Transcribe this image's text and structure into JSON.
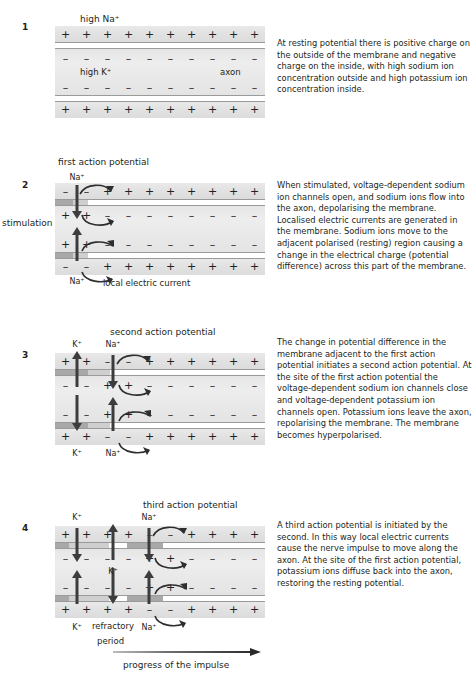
{
  "figure": {
    "bottom_arrow_label": "progress of the impulse",
    "side_label_stimulation": "stimulation"
  },
  "ions": {
    "sodium": "Na",
    "potassium": "K",
    "plus": "+",
    "minus": "–"
  },
  "panels": [
    {
      "number": "1",
      "top_label": "high Na⁺",
      "inside_label_left": "high K⁺",
      "inside_label_right": "axon",
      "text": "At resting potential there is positive charge on the outside of the membrane and negative charge on the inside, with high sodium ion concentration outside and high potassium ion concentration inside.",
      "outer_top_charges": "+ + + + + + + + + +",
      "inner_top_charges": "– – – – – – – – – –",
      "inner_bottom_charges": "– – – – – – – – – –",
      "outer_bottom_charges": "+ + + + + + + + + +"
    },
    {
      "number": "2",
      "top_label": "first action potential",
      "ion_label_top": "Na⁺",
      "ion_label_bottom": "Na⁺",
      "current_label": "local electric current",
      "side_label": "stimulation",
      "text": "When stimulated, voltage-dependent sodium ion channels open, and sodium ions flow into the axon, depolarising the membrane. Localised electric currents are generated in the membrane. Sodium ions move to the adjacent polarised (resting) region causing a change in the electrical charge (potential difference) across this part of the membrane."
    },
    {
      "number": "3",
      "top_label": "second action potential",
      "ion_label_k_top": "K⁺",
      "ion_label_k_bottom": "K⁺",
      "ion_label_na_top": "Na⁺",
      "ion_label_na_bottom": "Na⁺",
      "text": "The change in potential difference in the membrane adjacent to the first action potential initiates a second action potential. At the site of the first action potential the voltage-dependent sodium ion channels close and voltage-dependent potassium ion channels open. Potassium ions leave the axon, repolarising the membrane. The membrane becomes hyperpolarised."
    },
    {
      "number": "4",
      "top_label": "third action potential",
      "ion_label_k1_top": "K⁺",
      "ion_label_k1_bottom": "K⁺",
      "ion_label_k2_inside": "K⁺",
      "ion_label_na_top": "Na⁺",
      "ion_label_na_bottom": "Na⁺",
      "refractory_label_line1": "refractory",
      "refractory_label_line2": "period",
      "text": "A third action potential is initiated by the second. In this way local electric currents cause the nerve impulse to move along the axon. At the site of the first action potential, potassium ions diffuse back into the axon, restoring the resting potential."
    }
  ],
  "colors": {
    "ink": "#231f20",
    "membrane_open_channel": "#a8a8a8",
    "membrane_closed": "#ffffff",
    "extracellular": "#e4e4e4",
    "cytoplasm": "#e8e8e8",
    "arrow": "#3c3c3c"
  }
}
